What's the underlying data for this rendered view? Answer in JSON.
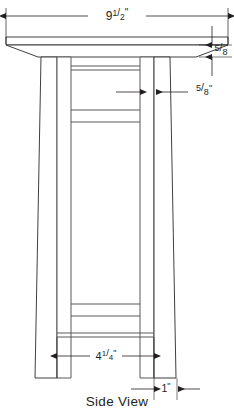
{
  "drawing": {
    "title": "Side View",
    "view_label": "Side View",
    "line_color": "#58585a",
    "outline_color": "#3f3f41",
    "text_color": "#231f20",
    "background": "#ffffff",
    "subject": "table-side-elevation"
  },
  "dimensions": [
    {
      "id": "top-width",
      "whole": "9",
      "numerator": "1",
      "denominator": "2",
      "unit": "\"",
      "full_label": "9 1/2\"",
      "position": "top",
      "measures": "tabletop-width"
    },
    {
      "id": "top-thickness",
      "whole": "",
      "numerator": "5",
      "denominator": "8",
      "unit": "",
      "full_label": "5/8",
      "position": "right-upper",
      "measures": "tabletop-thickness"
    },
    {
      "id": "leg-thickness",
      "whole": "",
      "numerator": "5",
      "denominator": "8",
      "unit": "\"",
      "full_label": "5/8\"",
      "position": "right-middle",
      "measures": "leg-thickness"
    },
    {
      "id": "inner-span",
      "whole": "4",
      "numerator": "1",
      "denominator": "4",
      "unit": "\"",
      "full_label": "4 1/4\"",
      "position": "bottom",
      "measures": "inner-span-between-feet"
    },
    {
      "id": "foot-width",
      "whole": "1",
      "numerator": "",
      "denominator": "",
      "unit": "\"",
      "full_label": "1\"",
      "position": "bottom-right",
      "measures": "foot-width"
    }
  ]
}
